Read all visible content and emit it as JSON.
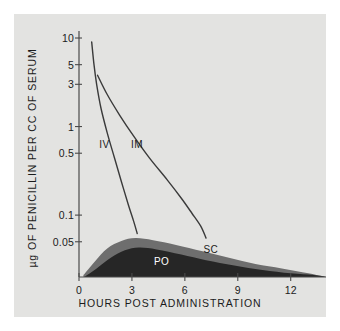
{
  "chart_data": {
    "type": "line",
    "title": "",
    "xlabel": "HOURS POST ADMINISTRATION",
    "ylabel": "µg OF PENICILLIN PER CC OF SERUM",
    "yscale": "log",
    "xlim": [
      0,
      14
    ],
    "ylim": [
      0.02,
      12
    ],
    "grid": false,
    "legend": "inline-curve-labels",
    "xticks": [
      {
        "value": 0,
        "label": "0"
      },
      {
        "value": 3,
        "label": "3"
      },
      {
        "value": 6,
        "label": "6"
      },
      {
        "value": 9,
        "label": "9"
      },
      {
        "value": 12,
        "label": "12"
      }
    ],
    "yticks": [
      {
        "value": 10,
        "label": "10"
      },
      {
        "value": 5,
        "label": "5"
      },
      {
        "value": 3,
        "label": "3"
      },
      {
        "value": 1,
        "label": "1"
      },
      {
        "value": 0.5,
        "label": "0.5"
      },
      {
        "value": 0.1,
        "label": "0.1"
      },
      {
        "value": 0.05,
        "label": "0.05"
      }
    ],
    "series": [
      {
        "name": "IV",
        "label": "IV",
        "style": "line",
        "color": "#3a3a3a",
        "points": [
          [
            0.72,
            9.0
          ],
          [
            0.85,
            5.0
          ],
          [
            1.0,
            3.0
          ],
          [
            1.25,
            1.6
          ],
          [
            1.6,
            0.85
          ],
          [
            2.0,
            0.45
          ],
          [
            2.4,
            0.24
          ],
          [
            2.8,
            0.13
          ],
          [
            3.1,
            0.085
          ],
          [
            3.3,
            0.062
          ]
        ]
      },
      {
        "name": "IM",
        "label": "IM",
        "style": "line",
        "color": "#3a3a3a",
        "points": [
          [
            1.05,
            3.8
          ],
          [
            1.6,
            2.3
          ],
          [
            2.3,
            1.35
          ],
          [
            3.1,
            0.78
          ],
          [
            4.0,
            0.44
          ],
          [
            5.0,
            0.25
          ],
          [
            5.8,
            0.155
          ],
          [
            6.4,
            0.105
          ],
          [
            6.9,
            0.075
          ],
          [
            7.2,
            0.055
          ]
        ]
      },
      {
        "name": "SC",
        "label": "SC",
        "style": "filled-band",
        "color": "#6e6e6e",
        "points": [
          [
            0.25,
            0.021
          ],
          [
            0.9,
            0.03
          ],
          [
            1.6,
            0.042
          ],
          [
            2.4,
            0.051
          ],
          [
            3.2,
            0.055
          ],
          [
            4.2,
            0.052
          ],
          [
            5.5,
            0.046
          ],
          [
            7.0,
            0.039
          ],
          [
            8.5,
            0.033
          ],
          [
            10.0,
            0.028
          ],
          [
            11.5,
            0.025
          ],
          [
            13.0,
            0.022
          ],
          [
            14.0,
            0.02
          ]
        ]
      },
      {
        "name": "PO",
        "label": "PO",
        "style": "filled-region",
        "color": "#262626",
        "points": [
          [
            0.3,
            0.02
          ],
          [
            1.0,
            0.025
          ],
          [
            1.8,
            0.033
          ],
          [
            2.6,
            0.04
          ],
          [
            3.4,
            0.043
          ],
          [
            4.4,
            0.041
          ],
          [
            5.8,
            0.036
          ],
          [
            7.2,
            0.031
          ],
          [
            8.8,
            0.027
          ],
          [
            10.4,
            0.024
          ],
          [
            12.0,
            0.022
          ],
          [
            13.3,
            0.021
          ],
          [
            14.0,
            0.02
          ]
        ]
      }
    ],
    "curve_labels": [
      {
        "text": "IV",
        "x": 1.55,
        "y": 0.62
      },
      {
        "text": "IM",
        "x": 3.35,
        "y": 0.62
      },
      {
        "text": "SC",
        "x": 7.45,
        "y": 0.0405
      },
      {
        "text": "PO",
        "x": 4.65,
        "y": 0.0295
      }
    ],
    "colors": {
      "panel_background": "#e3e3e1",
      "page_background": "#ffffff",
      "axis": "#4a4a4a",
      "text": "#1b1b1b",
      "sc_fill": "#6e6e6e",
      "po_fill": "#262626",
      "curve": "#3a3a3a"
    }
  }
}
